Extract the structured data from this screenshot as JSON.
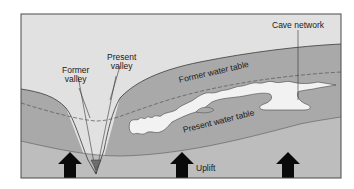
{
  "diagram": {
    "labels": {
      "former_valley_line1": "Former",
      "former_valley_line2": "valley",
      "present_valley_line1": "Present",
      "present_valley_line2": "valley",
      "cave_network": "Cave network",
      "former_water_table": "Former water table",
      "present_water_table": "Present water table",
      "uplift": "Uplift"
    },
    "arrows": [
      {
        "name": "uplift-arrow-left",
        "x": 70
      },
      {
        "name": "uplift-arrow-center",
        "x": 182
      },
      {
        "name": "uplift-arrow-right",
        "x": 288
      }
    ],
    "colors": {
      "sky": "#e1e1e1",
      "rock_upper": "#a9a9a9",
      "rock_lower": "#bdbdbd",
      "valley_fill": "#d4d4d4",
      "cave": "#f2f2f2",
      "river": "#6e6e6e",
      "frame": "#4a4a4a",
      "arrow": "#0a0a0a"
    }
  }
}
